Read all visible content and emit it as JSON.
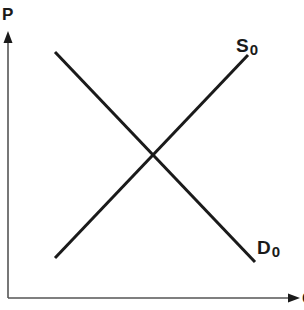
{
  "chart_data": {
    "type": "line",
    "title": "",
    "diagram_kind": "supply-and-demand",
    "xlabel": "Q",
    "ylabel": "P",
    "grid": false,
    "ticks": false,
    "series": [
      {
        "name": "S0",
        "label_main": "S",
        "label_sub": "0",
        "slope": "upward",
        "points": [
          [
            55,
            258
          ],
          [
            248,
            55
          ]
        ]
      },
      {
        "name": "D0",
        "label_main": "D",
        "label_sub": "0",
        "slope": "downward",
        "points": [
          [
            55,
            52
          ],
          [
            255,
            262
          ]
        ]
      }
    ],
    "equilibrium": {
      "x": 152,
      "y": 155
    }
  },
  "axes": {
    "y_label": "P",
    "x_label": "Q",
    "color": "#1a1a1a"
  },
  "colors": {
    "line": "#1a1a1a",
    "axis": "#555555",
    "background": "#ffffff"
  }
}
